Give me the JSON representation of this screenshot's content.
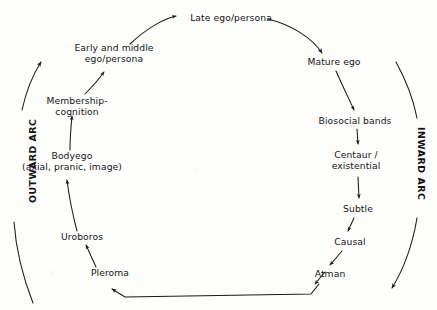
{
  "diagram": {
    "background_color": "#fdfdfc",
    "ink_color": "#161616",
    "arc_labels": {
      "outward": "OUTWARD ARC",
      "inward": "INWARD ARC"
    },
    "nodes": [
      {
        "id": "pleroma",
        "label": "Pleroma",
        "x": 110,
        "y": 272
      },
      {
        "id": "uroboros",
        "label": "Uroboros",
        "x": 82,
        "y": 236
      },
      {
        "id": "bodyego",
        "line1": "Bodyego",
        "line2": "(axial, pranic, image)",
        "x": 72,
        "y": 161
      },
      {
        "id": "membership",
        "line1": "Membership-",
        "line2": "cognition",
        "x": 77,
        "y": 101
      },
      {
        "id": "early-middle",
        "line1": "Early and middle",
        "line2": "ego/persona",
        "x": 114,
        "y": 47
      },
      {
        "id": "late-ego",
        "label": "Late ego/persona",
        "x": 231,
        "y": 18
      },
      {
        "id": "mature-ego",
        "label": "Mature ego",
        "x": 334,
        "y": 61
      },
      {
        "id": "biosocial",
        "label": "Biosocial bands",
        "x": 355,
        "y": 120
      },
      {
        "id": "centaur",
        "line1": "Centaur /",
        "line2": "existential",
        "x": 353,
        "y": 155
      },
      {
        "id": "subtle",
        "label": "Subtle",
        "x": 355,
        "y": 208
      },
      {
        "id": "causal",
        "label": "Causal",
        "x": 348,
        "y": 241
      },
      {
        "id": "atman",
        "label": "Atman",
        "x": 330,
        "y": 273
      }
    ],
    "connections": [
      {
        "from": "pleroma",
        "to": "uroboros"
      },
      {
        "from": "uroboros",
        "to": "bodyego"
      },
      {
        "from": "bodyego",
        "to": "membership"
      },
      {
        "from": "membership",
        "to": "early-middle"
      },
      {
        "from": "early-middle",
        "to": "late-ego"
      },
      {
        "from": "late-ego",
        "to": "mature-ego"
      },
      {
        "from": "mature-ego",
        "to": "biosocial"
      },
      {
        "from": "biosocial",
        "to": "centaur"
      },
      {
        "from": "centaur",
        "to": "subtle"
      },
      {
        "from": "subtle",
        "to": "causal"
      },
      {
        "from": "causal",
        "to": "atman"
      },
      {
        "from": "atman",
        "to": "pleroma"
      }
    ],
    "outer_arcs": [
      {
        "id": "outward-arc-arrow",
        "direction": "upward",
        "side": "left"
      },
      {
        "id": "inward-arc-arrow",
        "direction": "downward",
        "side": "right"
      }
    ]
  }
}
